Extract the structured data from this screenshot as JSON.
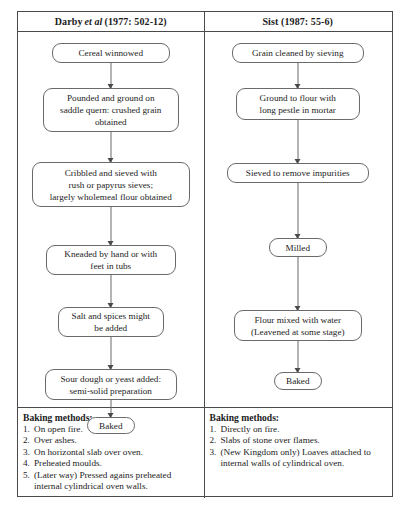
{
  "figure": {
    "columns": [
      {
        "id": "darby",
        "header_prefix": "Darby",
        "header_italic": "et al",
        "header_suffix": "(1977: 502-12)",
        "header_full": "Darby et al (1977: 502-12)",
        "nodes": [
          "Cereal winnowed",
          "Pounded and ground on\nsaddle quern: crushed grain\nobtained",
          "Cribbled and sieved with\nrush or papyrus sieves;\nlargely wholemeal flour obtained",
          "Kneaded by hand or with\nfeet in tubs",
          "Salt and spices might\nbe added",
          "Sour dough or yeast added:\nsemi-solid preparation",
          "Baked"
        ],
        "baking": {
          "title": "Baking methods:",
          "items": [
            {
              "num": "1.",
              "text": "On open fire."
            },
            {
              "num": "2.",
              "text": "Over ashes."
            },
            {
              "num": "3.",
              "text": "On horizontal slab over oven."
            },
            {
              "num": "4.",
              "text": "Preheated moulds."
            },
            {
              "num": "5.",
              "text": "(Later way) Pressed agains preheated internal cylindrical oven walls."
            }
          ]
        }
      },
      {
        "id": "sist",
        "header_prefix": "Sist (1987: 55-6)",
        "header_italic": "",
        "header_suffix": "",
        "header_full": "Sist (1987: 55-6)",
        "nodes": [
          "Grain cleaned by sieving",
          "Ground to flour with\nlong pestle in mortar",
          "Sieved to remove impurities",
          "Milled",
          "Flour mixed with water\n(Leavened at some stage)",
          "Baked"
        ],
        "baking": {
          "title": "Baking methods:",
          "items": [
            {
              "num": "1.",
              "text": "Directly on fire."
            },
            {
              "num": "2.",
              "text": "Slabs of stone over flames."
            },
            {
              "num": "3.",
              "text": "(New Kingdom only) Loaves attached to internal walls of cylindrical oven."
            }
          ]
        }
      }
    ],
    "colors": {
      "border": "#4a4a4a",
      "node_border": "#6a6a6a",
      "text": "#242424",
      "background": "#ffffff"
    }
  }
}
